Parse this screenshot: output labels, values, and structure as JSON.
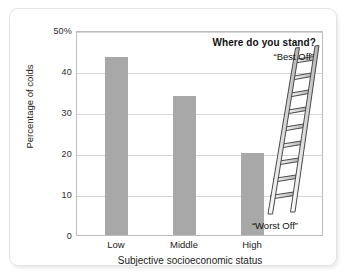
{
  "chart_data": {
    "type": "bar",
    "title": "",
    "categories": [
      "Low",
      "Middle",
      "High"
    ],
    "values": [
      43.5,
      34,
      20
    ],
    "xlabel": "Subjective socioeconomic status",
    "ylabel": "Percentage of colds",
    "ylim": [
      0,
      50
    ],
    "ytick_labels": [
      "0",
      "10",
      "20",
      "30",
      "40",
      "50%"
    ],
    "ytick_values": [
      0,
      10,
      20,
      30,
      40,
      50
    ],
    "grid": true,
    "legend": "none",
    "bar_color": "#a8a8a8",
    "annotations": [
      {
        "name": "where-do-you-stand",
        "text": "Where do you stand?",
        "bold": true
      },
      {
        "name": "best-off",
        "text": "“Best Off”",
        "bold": false
      },
      {
        "name": "worst-off",
        "text": "“Worst Off”",
        "bold": false
      }
    ],
    "illustration": {
      "name": "ladder-illustration",
      "rungs": 9,
      "rail_color": "#d8d8d8",
      "outline_color": "#4a4a4a"
    }
  }
}
